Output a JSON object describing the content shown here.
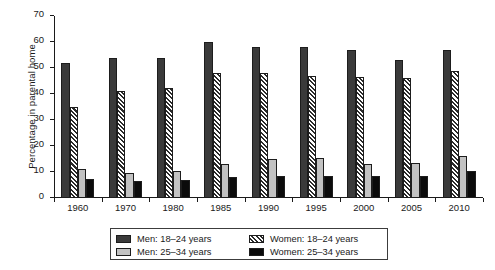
{
  "chart_data": {
    "type": "bar",
    "title": "",
    "xlabel": "",
    "ylabel": "Percentage in parental home",
    "ylim": [
      0,
      70
    ],
    "yticks": [
      0,
      10,
      20,
      30,
      40,
      50,
      60,
      70
    ],
    "grid": false,
    "legend_position": "bottom-center",
    "categories": [
      "1960",
      "1970",
      "1980",
      "1985",
      "1990",
      "1995",
      "2000",
      "2005",
      "2010"
    ],
    "series": [
      {
        "name": "Men: 18–24 years",
        "color": "#3a3a3a",
        "pattern": "solid-dark",
        "values": [
          52,
          54,
          54,
          60,
          58,
          58,
          57,
          53,
          57
        ]
      },
      {
        "name": "Women: 18–24 years",
        "color": "#2b2b2b",
        "pattern": "diagonal-hatch",
        "values": [
          35,
          41,
          42.5,
          48,
          48,
          47,
          46.5,
          46,
          49
        ]
      },
      {
        "name": "Men: 25–34 years",
        "color": "#c2c2c2",
        "pattern": "solid-light",
        "values": [
          11,
          9.5,
          10.5,
          13,
          15,
          15.5,
          13,
          13.5,
          16
        ]
      },
      {
        "name": "Women: 25–34 years",
        "color": "#0b0b0b",
        "pattern": "solid-black",
        "values": [
          7.5,
          6.5,
          7,
          8,
          8.5,
          8.5,
          8.5,
          8.5,
          10.5
        ]
      }
    ]
  }
}
